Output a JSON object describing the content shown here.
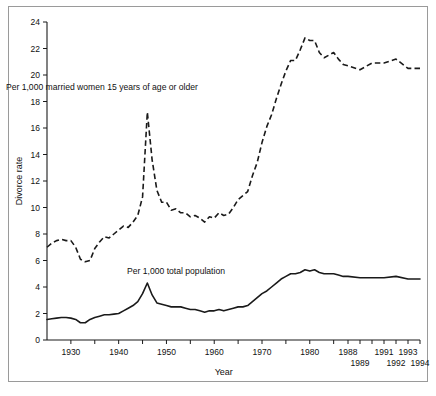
{
  "chart_data": {
    "type": "line",
    "title": "",
    "xlabel": "Year",
    "ylabel": "Divorce rate",
    "xlim": [
      1925,
      1994
    ],
    "ylim": [
      0,
      24
    ],
    "ytick_labels": [
      "0",
      "2",
      "4",
      "6",
      "8",
      "10",
      "12",
      "14",
      "16",
      "18",
      "20",
      "22",
      "24"
    ],
    "ytick_values": [
      0,
      2,
      4,
      6,
      8,
      10,
      12,
      14,
      16,
      18,
      20,
      22,
      24
    ],
    "xtick_values": [
      1930,
      1935,
      1940,
      1945,
      1950,
      1955,
      1960,
      1965,
      1970,
      1975,
      1980,
      1985,
      1988,
      1989,
      1990,
      1991,
      1992,
      1993,
      1994
    ],
    "xtick_labels_row1": [
      {
        "year": 1930,
        "label": "1930"
      },
      {
        "year": 1940,
        "label": "1940"
      },
      {
        "year": 1950,
        "label": "1950"
      },
      {
        "year": 1960,
        "label": "1960"
      },
      {
        "year": 1970,
        "label": "1970"
      },
      {
        "year": 1980,
        "label": "1980"
      },
      {
        "year": 1988,
        "label": "1988"
      },
      {
        "year": 1991,
        "label": "1991"
      },
      {
        "year": 1993,
        "label": "1993"
      }
    ],
    "xtick_labels_row2": [
      {
        "year": 1989,
        "label": "1989"
      },
      {
        "year": 1992,
        "label": "1992"
      },
      {
        "year": 1994,
        "label": "1994"
      }
    ],
    "grid": false,
    "legend_position": "inline-annotation",
    "annotations": [
      {
        "name": "married-women-label",
        "text": "Per 1,000 married women 15 years of age or older",
        "x": 1936.5,
        "y": 18.9
      },
      {
        "name": "total-population-label",
        "text": "Per 1,000 total population",
        "x": 1952.0,
        "y": 5.0
      }
    ],
    "series": [
      {
        "name": "Per 1,000 married women 15 years of age or older",
        "style": "dashed",
        "color": "#1a1a1a",
        "x": [
          1925,
          1926,
          1927,
          1928,
          1929,
          1930,
          1931,
          1932,
          1933,
          1934,
          1935,
          1936,
          1937,
          1938,
          1939,
          1940,
          1941,
          1942,
          1943,
          1944,
          1945,
          1946,
          1947,
          1948,
          1949,
          1950,
          1951,
          1952,
          1953,
          1954,
          1955,
          1956,
          1957,
          1958,
          1959,
          1960,
          1961,
          1962,
          1963,
          1964,
          1965,
          1966,
          1967,
          1968,
          1969,
          1970,
          1971,
          1972,
          1973,
          1974,
          1975,
          1976,
          1977,
          1978,
          1979,
          1980,
          1981,
          1982,
          1983,
          1984,
          1985,
          1986,
          1987,
          1988,
          1989,
          1990,
          1991,
          1992,
          1993,
          1994
        ],
        "y": [
          7.0,
          7.3,
          7.5,
          7.6,
          7.5,
          7.5,
          7.0,
          6.1,
          5.9,
          6.0,
          6.9,
          7.4,
          7.8,
          7.7,
          8.0,
          8.3,
          8.6,
          8.5,
          8.9,
          9.4,
          10.8,
          17.2,
          13.6,
          11.3,
          10.4,
          10.4,
          9.8,
          9.9,
          9.6,
          9.6,
          9.3,
          9.4,
          9.2,
          8.9,
          9.3,
          9.2,
          9.6,
          9.4,
          9.5,
          10.0,
          10.6,
          10.9,
          11.2,
          12.4,
          13.4,
          14.9,
          16.1,
          17.0,
          18.2,
          19.3,
          20.3,
          21.1,
          21.1,
          21.9,
          22.8,
          22.6,
          22.6,
          21.7,
          21.3,
          21.5,
          21.7,
          21.2,
          20.8,
          20.7,
          20.4,
          20.9,
          20.9,
          21.2,
          20.5,
          20.5
        ]
      },
      {
        "name": "Per 1,000 total population",
        "style": "solid",
        "color": "#1a1a1a",
        "x": [
          1925,
          1926,
          1927,
          1928,
          1929,
          1930,
          1931,
          1932,
          1933,
          1934,
          1935,
          1936,
          1937,
          1938,
          1939,
          1940,
          1941,
          1942,
          1943,
          1944,
          1945,
          1946,
          1947,
          1948,
          1949,
          1950,
          1951,
          1952,
          1953,
          1954,
          1955,
          1956,
          1957,
          1958,
          1959,
          1960,
          1961,
          1962,
          1963,
          1964,
          1965,
          1966,
          1967,
          1968,
          1969,
          1970,
          1971,
          1972,
          1973,
          1974,
          1975,
          1976,
          1977,
          1978,
          1979,
          1980,
          1981,
          1982,
          1983,
          1984,
          1985,
          1986,
          1987,
          1988,
          1989,
          1990,
          1991,
          1992,
          1993,
          1994
        ],
        "y": [
          1.55,
          1.6,
          1.65,
          1.7,
          1.7,
          1.65,
          1.55,
          1.3,
          1.3,
          1.55,
          1.7,
          1.8,
          1.9,
          1.9,
          1.95,
          2.0,
          2.2,
          2.4,
          2.6,
          2.9,
          3.5,
          4.3,
          3.4,
          2.8,
          2.7,
          2.6,
          2.5,
          2.5,
          2.5,
          2.4,
          2.3,
          2.3,
          2.2,
          2.1,
          2.2,
          2.2,
          2.3,
          2.2,
          2.3,
          2.4,
          2.5,
          2.5,
          2.6,
          2.9,
          3.2,
          3.5,
          3.7,
          4.0,
          4.3,
          4.6,
          4.8,
          5.0,
          5.0,
          5.1,
          5.3,
          5.2,
          5.3,
          5.1,
          5.0,
          5.0,
          5.0,
          4.9,
          4.8,
          4.8,
          4.7,
          4.7,
          4.7,
          4.8,
          4.6,
          4.6
        ]
      }
    ]
  },
  "figure": {
    "ylabel": "Divorce rate",
    "xlabel": "Year"
  }
}
